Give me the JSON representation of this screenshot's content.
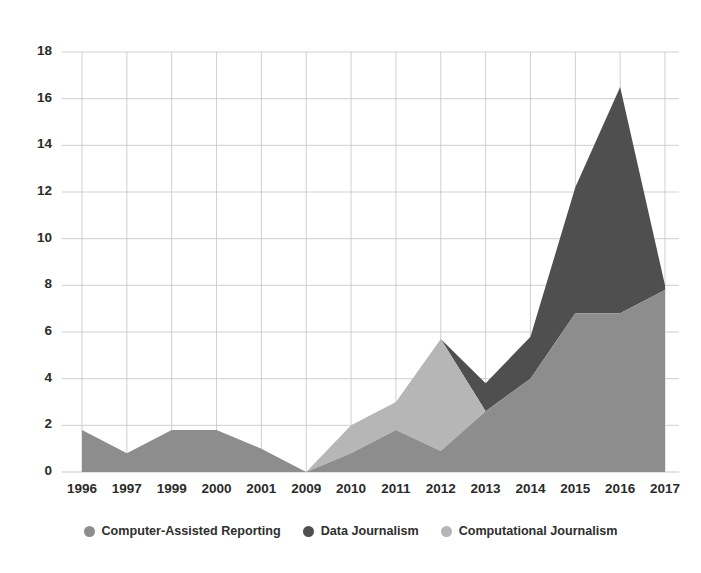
{
  "chart_data": {
    "type": "area",
    "stacked": true,
    "title": "",
    "xlabel": "",
    "ylabel": "",
    "grid": true,
    "legend_position": "bottom",
    "ylim": [
      0,
      18
    ],
    "yticks": [
      0,
      2,
      4,
      6,
      8,
      10,
      12,
      14,
      16,
      18
    ],
    "ytick_labels": [
      "0",
      "2",
      "4",
      "6",
      "8",
      "10",
      "12",
      "14",
      "16",
      "18"
    ],
    "categories": [
      "1996",
      "1997",
      "1999",
      "2000",
      "2001",
      "2009",
      "2010",
      "2011",
      "2012",
      "2013",
      "2014",
      "2015",
      "2016",
      "2017"
    ],
    "series": [
      {
        "name": "Computer-Assisted Reporting",
        "color": "#8d8d8d",
        "values": [
          1.8,
          0.8,
          1.8,
          1.8,
          1.0,
          0.0,
          0.8,
          1.8,
          0.9,
          2.6,
          4.0,
          6.8,
          6.8,
          7.8
        ]
      },
      {
        "name": "Data Journalism",
        "color": "#4f4f4f",
        "values": [
          0.0,
          0.0,
          0.0,
          0.0,
          0.0,
          0.0,
          0.0,
          0.0,
          0.0,
          1.2,
          1.8,
          5.4,
          9.7,
          0.2
        ]
      },
      {
        "name": "Computational Journalism",
        "color": "#b6b6b6",
        "values": [
          0.0,
          0.0,
          0.0,
          0.0,
          0.0,
          0.0,
          1.2,
          1.2,
          4.8,
          0.0,
          0.0,
          0.0,
          0.0,
          0.0
        ]
      }
    ],
    "stack_order": [
      "Computer-Assisted Reporting",
      "Computational Journalism",
      "Data Journalism"
    ],
    "stack_totals": [
      1.8,
      0.8,
      1.8,
      1.8,
      1.0,
      0.0,
      2.0,
      3.0,
      5.7,
      3.8,
      5.8,
      12.2,
      16.5,
      8.0
    ]
  },
  "legend": {
    "items": [
      {
        "label": "Computer-Assisted Reporting",
        "marker": "legend-dot-icon",
        "color": "#8d8d8d"
      },
      {
        "label": "Data Journalism",
        "marker": "legend-dot-icon",
        "color": "#4f4f4f"
      },
      {
        "label": "Computational Journalism",
        "marker": "legend-dot-icon",
        "color": "#b6b6b6"
      }
    ]
  },
  "axes": {
    "grid_color": "#c9c9c9",
    "text_color": "#2b2b2b"
  }
}
